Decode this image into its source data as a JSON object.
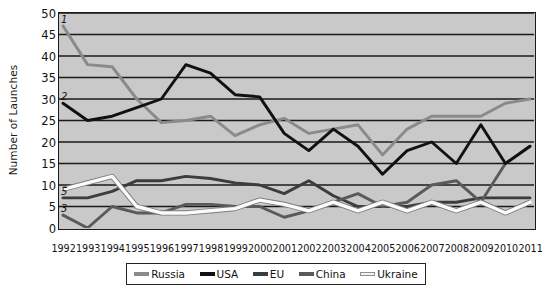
{
  "chart_data": {
    "type": "line",
    "title": "",
    "xlabel": "",
    "ylabel": "Number of Launches",
    "ylim": [
      0,
      50
    ],
    "ytick_step": 5,
    "yticks": [
      0,
      5,
      10,
      15,
      20,
      25,
      30,
      35,
      40,
      45,
      50
    ],
    "grid": true,
    "legend_position": "bottom",
    "plot_background": "#c9c9c9",
    "categories": [
      "1992",
      "1993",
      "1994",
      "1995",
      "1996",
      "1997",
      "1998",
      "1999",
      "2000",
      "2001",
      "2002",
      "2003",
      "2004",
      "2005",
      "2006",
      "2007",
      "2008",
      "2009",
      "2010",
      "2011"
    ],
    "series": [
      {
        "name": "Russia",
        "color": "#8a8a8a",
        "marker_label": "1",
        "values": [
          47,
          38,
          37.5,
          30,
          24.5,
          25,
          26,
          21.5,
          24,
          25.5,
          22,
          23,
          24,
          17,
          23,
          26,
          26,
          26,
          29,
          30
        ]
      },
      {
        "name": "USA",
        "color": "#111111",
        "marker_label": "2",
        "values": [
          29,
          25,
          26,
          28,
          30,
          38,
          36,
          31,
          30.5,
          22,
          18,
          23,
          19,
          12.5,
          18,
          20,
          15,
          24,
          15,
          19
        ]
      },
      {
        "name": "EU",
        "color": "#3c3c3c",
        "marker_label": "5",
        "values": [
          7,
          7,
          8.5,
          11,
          11,
          12,
          11.5,
          10.5,
          10,
          8,
          11,
          7.5,
          5,
          5,
          5,
          6,
          6,
          7,
          7,
          7
        ]
      },
      {
        "name": "China",
        "color": "#5a5a5a",
        "marker_label": "3",
        "values": [
          3,
          0,
          5,
          3.5,
          3.5,
          5.5,
          5.5,
          5,
          5,
          2.5,
          4,
          6,
          8,
          5,
          6,
          10,
          11,
          6,
          15,
          19
        ]
      },
      {
        "name": "Ukraine",
        "color": "#fbfbfb",
        "marker_label": "",
        "values": [
          9,
          10.5,
          12,
          5,
          3.5,
          3.5,
          4,
          4.5,
          6.5,
          5.5,
          4,
          6,
          4,
          6,
          4,
          6,
          4,
          6,
          3.5,
          6
        ]
      }
    ]
  },
  "legend": {
    "items": [
      {
        "label": "Russia"
      },
      {
        "label": "USA"
      },
      {
        "label": "EU"
      },
      {
        "label": "China"
      },
      {
        "label": "Ukraine"
      }
    ]
  }
}
